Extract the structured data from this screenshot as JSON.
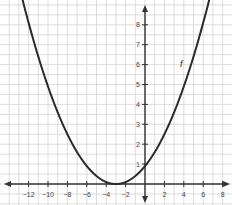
{
  "chart_data": {
    "type": "line",
    "title": "",
    "xlabel": "",
    "ylabel": "",
    "xlim": [
      -14,
      8.5
    ],
    "ylim": [
      -0.9,
      9
    ],
    "grid": true,
    "x_ticks": [
      -12,
      -10,
      -8,
      -6,
      -4,
      -2,
      2,
      4,
      6,
      8
    ],
    "y_ticks": [
      1,
      2,
      3,
      4,
      5,
      6,
      7,
      8
    ],
    "series": [
      {
        "name": "f",
        "equation": "f(x) = 0.1(x + 3)^2",
        "vertex": [
          -3,
          0
        ],
        "points": [
          [
            -12,
            8.1
          ],
          [
            -10,
            4.9
          ],
          [
            -8,
            2.5
          ],
          [
            -6,
            0.9
          ],
          [
            -3,
            0
          ],
          [
            0,
            0.9
          ],
          [
            2,
            2.5
          ],
          [
            4,
            4.9
          ],
          [
            6,
            8.1
          ]
        ]
      }
    ],
    "annotations": [
      {
        "text": "f",
        "x": 3.6,
        "y": 5.9
      }
    ]
  },
  "labels": {
    "curve": "f"
  }
}
